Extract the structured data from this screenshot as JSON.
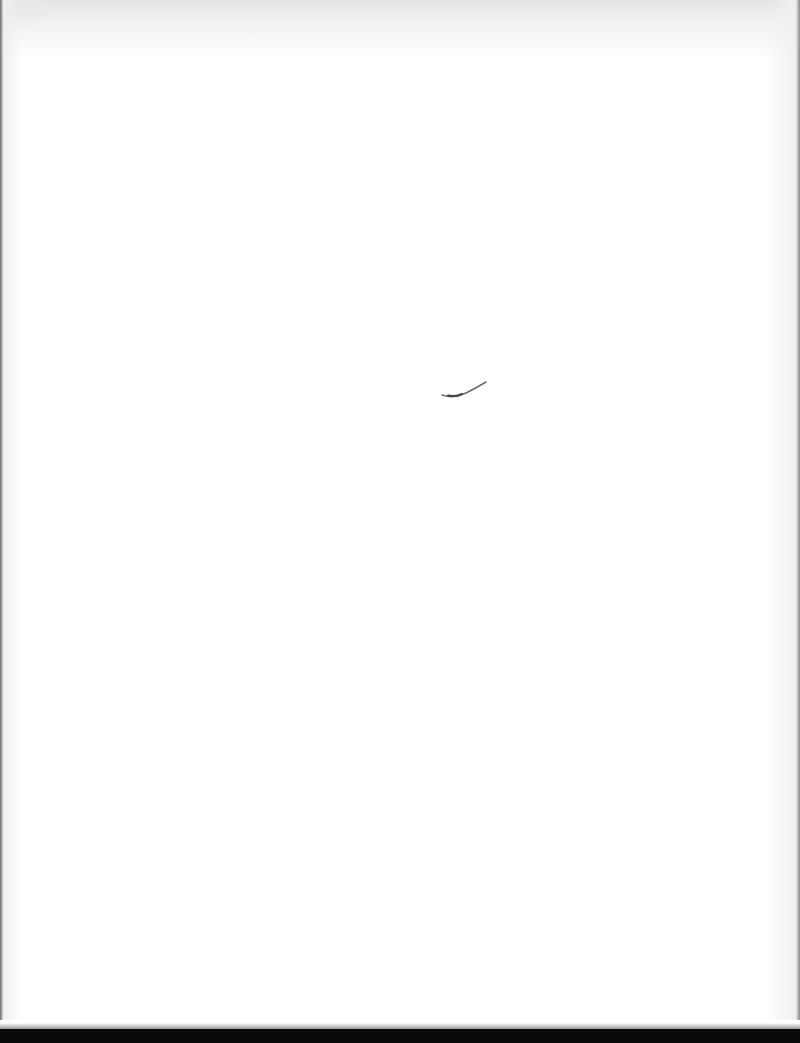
{
  "document": {
    "type": "scanned-page",
    "content_state": "blank",
    "visible_text": "",
    "marks": [
      {
        "kind": "pencil-stroke",
        "description": "small curved pencil mark near page center"
      }
    ],
    "colors": {
      "paper": "#ffffff",
      "top_shading": "#e4e4e4",
      "bottom_band": "#0a0a0a",
      "pencil": "#6e6e6e"
    }
  }
}
